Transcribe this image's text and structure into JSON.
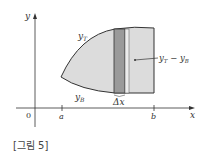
{
  "figure": {
    "caption": "[그림 5]",
    "axes": {
      "x_label": "x",
      "y_label": "y",
      "origin_label": "0",
      "ticks": [
        {
          "label": "a"
        },
        {
          "label": "b"
        }
      ]
    },
    "curves": {
      "top_label": "y",
      "top_sub": "T",
      "bottom_label": "y",
      "bottom_sub": "B"
    },
    "strip": {
      "width_label": "Δx",
      "height_label_main": "y",
      "height_label_sub1": "T",
      "height_label_minus": " − ",
      "height_label_main2": "y",
      "height_label_sub2": "B"
    },
    "colors": {
      "region_fill": "#dcdcdc",
      "strip_fill": "#9a9a9a",
      "strip_light": "#ececec",
      "outline": "#333333"
    }
  }
}
